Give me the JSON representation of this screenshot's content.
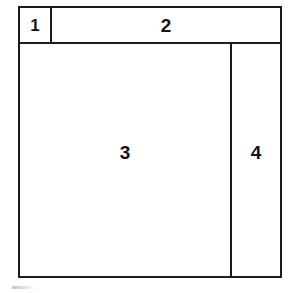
{
  "figure": {
    "type": "layout-wireframe-diagram",
    "background_color": "#ffffff",
    "line_color": "#1c1c1c",
    "text_color": "#141414",
    "regions": [
      {
        "id": "1",
        "label": "1",
        "name": "top-left-small-region",
        "position": "top-left",
        "bounds": {
          "x": 18,
          "y": 6,
          "width": 34,
          "height": 38
        }
      },
      {
        "id": "2",
        "label": "2",
        "name": "top-banner-region",
        "position": "top-right-wide",
        "bounds": {
          "x": 52,
          "y": 6,
          "width": 230,
          "height": 38
        }
      },
      {
        "id": "3",
        "label": "3",
        "name": "main-content-region",
        "position": "center-left-large",
        "bounds": {
          "x": 18,
          "y": 44,
          "width": 214,
          "height": 234
        }
      },
      {
        "id": "4",
        "label": "4",
        "name": "right-sidebar-region",
        "position": "right-column",
        "bounds": {
          "x": 232,
          "y": 44,
          "width": 50,
          "height": 234
        }
      }
    ],
    "artifacts": [
      {
        "name": "scan-smudge",
        "description": "faint grey scan mark below figure",
        "bounds": {
          "x": 12,
          "y": 286,
          "width": 24,
          "height": 3
        }
      }
    ]
  }
}
